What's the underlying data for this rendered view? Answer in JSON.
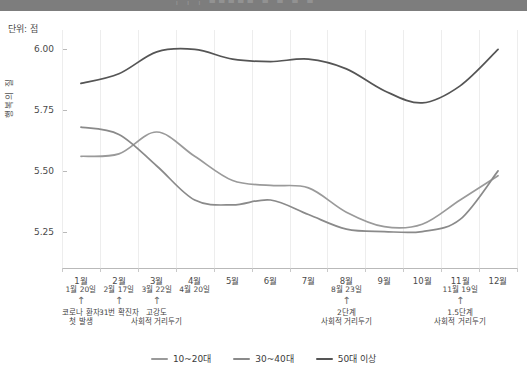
{
  "header": {
    "band_text": "¦ ¦ ¦   ▪▪▪▪▪ ▪ ▪ ▪ ▪"
  },
  "axes": {
    "unit_caption": "단위: 점",
    "y_title": "행복의 질",
    "y_ticks": [
      "6.00",
      "5.75",
      "5.50",
      "5.25"
    ],
    "y_values": [
      6.0,
      5.75,
      5.5,
      5.25
    ],
    "x_ticks": [
      "1월",
      "2월",
      "3월",
      "4월",
      "5월",
      "6월",
      "7월",
      "8월",
      "9월",
      "10월",
      "11월",
      "12월"
    ]
  },
  "events": [
    {
      "date": "1월 20일",
      "desc": "코로나 환자\n첫 발생",
      "month": 1
    },
    {
      "date": "2월 17일",
      "desc": "31번 확진자",
      "month": 2
    },
    {
      "date": "3월 22일",
      "desc": "고강도\n사회적 거리두기",
      "month": 3
    },
    {
      "date": "4월 20일",
      "desc": "",
      "month": 4
    },
    {
      "date": "8월 23일",
      "desc": "2단계\n사회적 거리두기",
      "month": 8
    },
    {
      "date": "11월 19일",
      "desc": "1.5단계\n사회적 거리두기",
      "month": 11
    }
  ],
  "legend": {
    "items": [
      {
        "label": "10~20대",
        "color": "#9a9a9a"
      },
      {
        "label": "30~40대",
        "color": "#8a8a8a"
      },
      {
        "label": "50대 이상",
        "color": "#555555"
      }
    ]
  },
  "chart_data": {
    "type": "line",
    "title": "",
    "subtitle": "",
    "xlabel": "",
    "ylabel": "행복의 질",
    "unit": "단위: 점",
    "ylim": [
      5.1,
      6.08
    ],
    "xlim": [
      0.5,
      12.5
    ],
    "grid": "vertical",
    "legend_position": "bottom-center",
    "x": [
      1,
      2,
      3,
      4,
      5,
      6,
      7,
      8,
      9,
      10,
      11,
      12
    ],
    "categories": [
      "1월",
      "2월",
      "3월",
      "4월",
      "5월",
      "6월",
      "7월",
      "8월",
      "9월",
      "10월",
      "11월",
      "12월"
    ],
    "series": [
      {
        "name": "10~20대",
        "color": "#9a9a9a",
        "values": [
          5.56,
          5.57,
          5.66,
          5.56,
          5.46,
          5.44,
          5.43,
          5.33,
          5.27,
          5.28,
          5.38,
          5.48
        ]
      },
      {
        "name": "30~40대",
        "color": "#8a8a8a",
        "values": [
          5.68,
          5.65,
          5.52,
          5.38,
          5.36,
          5.38,
          5.32,
          5.26,
          5.25,
          5.25,
          5.3,
          5.5
        ]
      },
      {
        "name": "50대 이상",
        "color": "#555555",
        "values": [
          5.86,
          5.9,
          5.99,
          6.0,
          5.96,
          5.95,
          5.96,
          5.92,
          5.83,
          5.78,
          5.85,
          6.0
        ]
      }
    ],
    "annotations": [
      {
        "x": 1,
        "date": "1월 20일",
        "text": "코로나 환자 첫 발생"
      },
      {
        "x": 2,
        "date": "2월 17일",
        "text": "31번 확진자"
      },
      {
        "x": 3,
        "date": "3월 22일",
        "text": "고강도 사회적 거리두기"
      },
      {
        "x": 4,
        "date": "4월 20일",
        "text": ""
      },
      {
        "x": 8,
        "date": "8월 23일",
        "text": "2단계 사회적 거리두기"
      },
      {
        "x": 11,
        "date": "11월 19일",
        "text": "1.5단계 사회적 거리두기"
      }
    ]
  }
}
